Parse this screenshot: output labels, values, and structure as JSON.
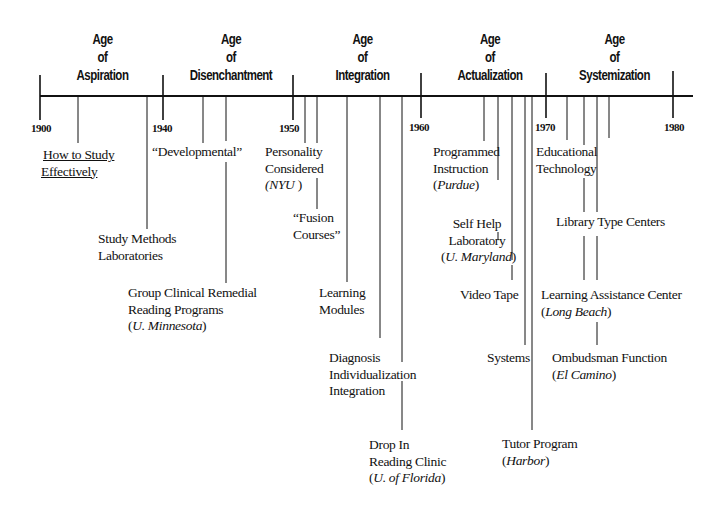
{
  "diagram": {
    "type": "timeline",
    "axis": {
      "start_year": 1900,
      "end_year": 1980,
      "year_labels": [
        "1900",
        "1940",
        "1950",
        "1960",
        "1970",
        "1980"
      ]
    },
    "ages": [
      {
        "line1": "Age",
        "line2": "of",
        "line3": "Aspiration"
      },
      {
        "line1": "Age",
        "line2": "of",
        "line3": "Disenchantment"
      },
      {
        "line1": "Age",
        "line2": "of",
        "line3": "Integration"
      },
      {
        "line1": "Age",
        "line2": "of",
        "line3": "Actualization"
      },
      {
        "line1": "Age",
        "line2": "of",
        "line3": "Systemization"
      }
    ],
    "events": [
      {
        "lines": [
          "How to Study",
          "Effectively"
        ],
        "note": ""
      },
      {
        "lines": [
          "Study Methods",
          "Laboratories"
        ],
        "note": ""
      },
      {
        "lines": [
          "“Developmental”"
        ],
        "note": ""
      },
      {
        "lines": [
          "Group Clinical Remedial",
          "Reading Programs"
        ],
        "note": "U. Minnesota"
      },
      {
        "lines": [
          "Personality",
          "Considered"
        ],
        "note": "NYU"
      },
      {
        "lines": [
          "“Fusion",
          "Courses”"
        ],
        "note": ""
      },
      {
        "lines": [
          "Learning",
          "Modules"
        ],
        "note": ""
      },
      {
        "lines": [
          "Diagnosis",
          "Individualization",
          "Integration"
        ],
        "note": ""
      },
      {
        "lines": [
          "Drop In",
          "Reading Clinic"
        ],
        "note": "U. of Florida"
      },
      {
        "lines": [
          "Programmed",
          "Instruction"
        ],
        "note": "Purdue"
      },
      {
        "lines": [
          "Self Help",
          "Laboratory"
        ],
        "note": "U. Maryland"
      },
      {
        "lines": [
          "Video Tape"
        ],
        "note": ""
      },
      {
        "lines": [
          "Systems"
        ],
        "note": ""
      },
      {
        "lines": [
          "Tutor Program"
        ],
        "note": "Harbor"
      },
      {
        "lines": [
          "Educational",
          "Technology"
        ],
        "note": ""
      },
      {
        "lines": [
          "Library Type Centers"
        ],
        "note": ""
      },
      {
        "lines": [
          "Learning Assistance Center"
        ],
        "note": "Long Beach"
      },
      {
        "lines": [
          "Ombudsman Function"
        ],
        "note": "El Camino"
      }
    ],
    "paren_open": "(",
    "paren_close": ")"
  }
}
